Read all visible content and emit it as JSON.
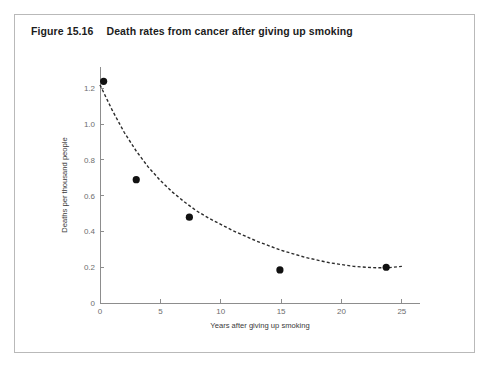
{
  "figure": {
    "number": "Figure 15.16",
    "title": "Death rates from cancer after giving up smoking"
  },
  "colors": {
    "frame_border": "#b9b9b9",
    "axis": "#8d8d8d",
    "tick_text": "#6d6d6d",
    "axis_title_text": "#3a3a3a",
    "curve": "#2b2b2b",
    "marker": "#111111",
    "background": "#ffffff",
    "title_text": "#1c1c1c"
  },
  "chart_data": {
    "type": "scatter",
    "title": "Death rates from cancer after giving up smoking",
    "xlabel": "Years after giving up smoking",
    "ylabel": "Deaths per thousand people",
    "xlim": [
      0,
      26.5
    ],
    "ylim": [
      0,
      1.32
    ],
    "xticks": [
      0,
      5,
      10,
      15,
      20,
      25
    ],
    "xtick_labels": [
      "0",
      "5",
      "10",
      "15",
      "20",
      "25"
    ],
    "yticks": [
      0,
      0.2,
      0.4,
      0.6,
      0.8,
      1.0,
      1.2
    ],
    "ytick_labels": [
      "0",
      "0.2",
      "0.4",
      "0.6",
      "0.8",
      "1.0",
      "1.2"
    ],
    "grid": false,
    "legend": false,
    "series": [
      {
        "name": "Observed death rates",
        "marker": "filled-circle",
        "x": [
          0.3,
          3.0,
          7.4,
          14.9,
          23.7
        ],
        "y": [
          1.24,
          0.69,
          0.48,
          0.185,
          0.2
        ]
      },
      {
        "name": "Fitted curve",
        "style": "dashed",
        "x": [
          0.0,
          1.0,
          2.0,
          3.0,
          4.0,
          5.0,
          6.0,
          7.0,
          8.0,
          9.0,
          10.0,
          11.0,
          12.0,
          13.0,
          14.0,
          15.0,
          16.0,
          17.0,
          18.0,
          19.0,
          20.0,
          21.0,
          22.0,
          23.0,
          24.0,
          25.0
        ],
        "y": [
          1.22,
          1.08,
          0.955,
          0.85,
          0.76,
          0.685,
          0.62,
          0.565,
          0.515,
          0.475,
          0.44,
          0.405,
          0.375,
          0.345,
          0.32,
          0.295,
          0.275,
          0.255,
          0.24,
          0.225,
          0.215,
          0.205,
          0.2,
          0.197,
          0.198,
          0.205
        ]
      }
    ]
  }
}
